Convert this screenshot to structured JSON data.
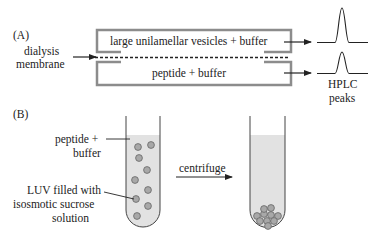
{
  "panel_a": {
    "label": "(A)",
    "membrane_label_line1": "dialysis",
    "membrane_label_line2": "membrane",
    "top_chamber": "large unilamellar vesicles + buffer",
    "bottom_chamber": "peptide + buffer",
    "output_label_line1": "HPLC",
    "output_label_line2": "peaks"
  },
  "panel_b": {
    "label": "(B)",
    "liquid_label_line1": "peptide +",
    "liquid_label_line2": "buffer",
    "luv_label_line1": "LUV filled with",
    "luv_label_line2": "isosmotic sucrose",
    "luv_label_line3": "solution",
    "process_label": "centrifuge"
  },
  "colors": {
    "box_stroke": "#8c8c8c",
    "liquid_fill": "#e2e2e2",
    "vesicle_fill": "#a8a8a8",
    "line": "#222222"
  }
}
